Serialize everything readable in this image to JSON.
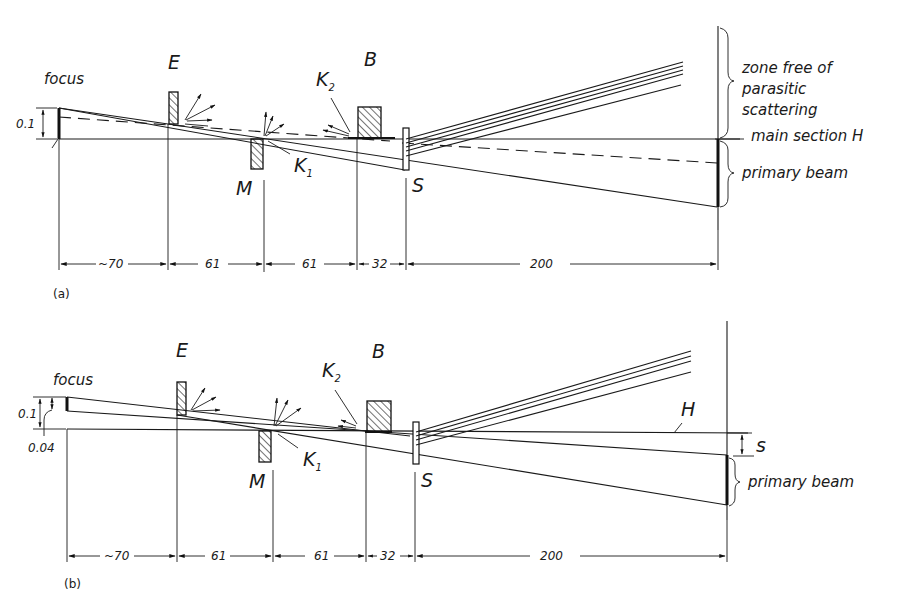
{
  "figure": {
    "panels": [
      {
        "id": "a",
        "label": "(a)",
        "source_label": "focus",
        "source_height": "0.1",
        "elements": {
          "E": "E",
          "M": "M",
          "K1": "K",
          "K1_sub": "1",
          "K2": "K",
          "K2_sub": "2",
          "B": "B",
          "S": "S"
        },
        "annotations": {
          "zone_line1": "zone free of",
          "zone_line2": "parasitic",
          "zone_line3": "scattering",
          "main_section": "main section H",
          "primary_beam": "primary beam"
        },
        "dimensions": [
          "~70",
          "61",
          "61",
          "32",
          "200"
        ]
      },
      {
        "id": "b",
        "label": "(b)",
        "source_label": "focus",
        "source_height": "0.1",
        "source_offset": "0.04",
        "elements": {
          "E": "E",
          "M": "M",
          "K1": "K",
          "K1_sub": "1",
          "K2": "K",
          "K2_sub": "2",
          "B": "B",
          "S": "S",
          "H": "H",
          "s": "s"
        },
        "annotations": {
          "primary_beam": "primary beam"
        },
        "dimensions": [
          "~70",
          "61",
          "61",
          "32",
          "200"
        ]
      }
    ]
  }
}
